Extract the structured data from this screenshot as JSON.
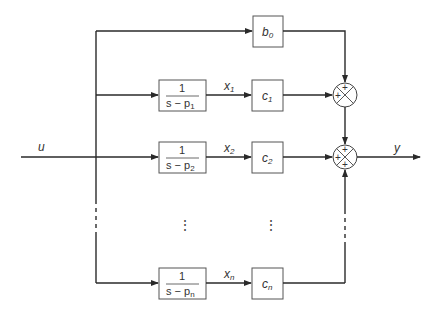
{
  "diagram": {
    "type": "block-diagram",
    "title": "",
    "input_label": "u",
    "output_label": "y",
    "feedthrough_block": {
      "label": "b",
      "subscript": "0"
    },
    "branches": [
      {
        "transfer": {
          "numerator": "1",
          "denominator_prefix": "s − p",
          "subscript": "1"
        },
        "state": {
          "label": "x",
          "subscript": "1"
        },
        "gain": {
          "label": "c",
          "subscript": "1"
        }
      },
      {
        "transfer": {
          "numerator": "1",
          "denominator_prefix": "s − p",
          "subscript": "2"
        },
        "state": {
          "label": "x",
          "subscript": "2"
        },
        "gain": {
          "label": "c",
          "subscript": "2"
        }
      },
      {
        "transfer": {
          "numerator": "1",
          "denominator_prefix": "s − p",
          "subscript": "n"
        },
        "state": {
          "label": "x",
          "subscript": "n"
        },
        "gain": {
          "label": "c",
          "subscript": "n"
        }
      }
    ],
    "ellipsis": "⋮",
    "summing_junctions": [
      {
        "signs": [
          "+",
          "+"
        ]
      },
      {
        "signs": [
          "+",
          "+",
          "+"
        ]
      }
    ]
  }
}
